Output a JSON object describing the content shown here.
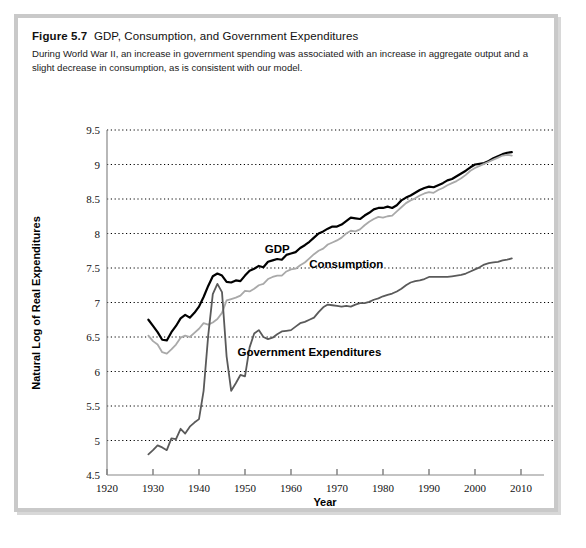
{
  "figure": {
    "label": "Figure 5.7",
    "title": "GDP, Consumption, and Government Expenditures",
    "description": "During World War II, an increase in government spending was associated with an increase in aggregate output and a slight decrease in consumption, as is consistent with our model."
  },
  "chart_data": {
    "type": "line",
    "title": "GDP, Consumption, and Government Expenditures",
    "xlabel": "Year",
    "ylabel": "Natural Log of Real Expenditures",
    "xlim": [
      1920,
      2015
    ],
    "ylim": [
      4.5,
      9.5
    ],
    "xticks": [
      1920,
      1930,
      1940,
      1950,
      1960,
      1970,
      1980,
      1990,
      2000,
      2010
    ],
    "yticks": [
      4.5,
      5,
      5.5,
      6,
      6.5,
      7,
      7.5,
      8,
      8.5,
      9,
      9.5
    ],
    "grid": "horizontal-dotted",
    "legend": "inline-annotations",
    "colors": {
      "gdp": "#000000",
      "consumption": "#a9a9a9",
      "government": "#5a5a5a"
    },
    "annotations": [
      {
        "text": "GDP",
        "x": 1957,
        "y": 7.72
      },
      {
        "text": "Consumption",
        "x": 1972,
        "y": 7.5
      },
      {
        "text": "Government Expenditures",
        "x": 1964,
        "y": 6.22
      }
    ],
    "series": [
      {
        "name": "GDP",
        "color": "#000000",
        "x": [
          1929,
          1930,
          1931,
          1932,
          1933,
          1934,
          1935,
          1936,
          1937,
          1938,
          1939,
          1940,
          1941,
          1942,
          1943,
          1944,
          1945,
          1946,
          1947,
          1948,
          1949,
          1950,
          1951,
          1952,
          1953,
          1954,
          1955,
          1956,
          1957,
          1958,
          1959,
          1960,
          1961,
          1962,
          1963,
          1964,
          1965,
          1966,
          1967,
          1968,
          1969,
          1970,
          1971,
          1972,
          1973,
          1974,
          1975,
          1976,
          1977,
          1978,
          1979,
          1980,
          1981,
          1982,
          1983,
          1984,
          1985,
          1986,
          1987,
          1988,
          1989,
          1990,
          1991,
          1992,
          1993,
          1994,
          1995,
          1996,
          1997,
          1998,
          1999,
          2000,
          2001,
          2002,
          2003,
          2004,
          2005,
          2006,
          2007,
          2008
        ],
        "y": [
          6.75,
          6.66,
          6.57,
          6.46,
          6.45,
          6.57,
          6.66,
          6.77,
          6.82,
          6.78,
          6.85,
          6.94,
          7.08,
          7.24,
          7.38,
          7.42,
          7.39,
          7.3,
          7.29,
          7.32,
          7.31,
          7.39,
          7.46,
          7.49,
          7.53,
          7.51,
          7.59,
          7.61,
          7.63,
          7.62,
          7.69,
          7.71,
          7.73,
          7.79,
          7.83,
          7.88,
          7.94,
          8.0,
          8.03,
          8.07,
          8.1,
          8.1,
          8.13,
          8.18,
          8.23,
          8.22,
          8.21,
          8.26,
          8.3,
          8.35,
          8.37,
          8.37,
          8.39,
          8.37,
          8.41,
          8.48,
          8.52,
          8.55,
          8.59,
          8.63,
          8.66,
          8.68,
          8.67,
          8.7,
          8.73,
          8.77,
          8.79,
          8.83,
          8.87,
          8.91,
          8.96,
          9.0,
          9.01,
          9.02,
          9.05,
          9.09,
          9.12,
          9.15,
          9.17,
          9.18
        ]
      },
      {
        "name": "Consumption",
        "color": "#a9a9a9",
        "x": [
          1929,
          1930,
          1931,
          1932,
          1933,
          1934,
          1935,
          1936,
          1937,
          1938,
          1939,
          1940,
          1941,
          1942,
          1943,
          1944,
          1945,
          1946,
          1947,
          1948,
          1949,
          1950,
          1951,
          1952,
          1953,
          1954,
          1955,
          1956,
          1957,
          1958,
          1959,
          1960,
          1961,
          1962,
          1963,
          1964,
          1965,
          1966,
          1967,
          1968,
          1969,
          1970,
          1971,
          1972,
          1973,
          1974,
          1975,
          1976,
          1977,
          1978,
          1979,
          1980,
          1981,
          1982,
          1983,
          1984,
          1985,
          1986,
          1987,
          1988,
          1989,
          1990,
          1991,
          1992,
          1993,
          1994,
          1995,
          1996,
          1997,
          1998,
          1999,
          2000,
          2001,
          2002,
          2003,
          2004,
          2005,
          2006,
          2007,
          2008
        ],
        "y": [
          6.52,
          6.44,
          6.39,
          6.28,
          6.26,
          6.32,
          6.39,
          6.49,
          6.52,
          6.5,
          6.56,
          6.62,
          6.7,
          6.68,
          6.71,
          6.76,
          6.85,
          7.03,
          7.05,
          7.07,
          7.1,
          7.17,
          7.16,
          7.2,
          7.25,
          7.27,
          7.34,
          7.37,
          7.39,
          7.39,
          7.45,
          7.48,
          7.49,
          7.54,
          7.58,
          7.64,
          7.7,
          7.75,
          7.78,
          7.84,
          7.87,
          7.9,
          7.94,
          8.0,
          8.04,
          8.03,
          8.06,
          8.12,
          8.17,
          8.21,
          8.24,
          8.23,
          8.25,
          8.26,
          8.32,
          8.38,
          8.44,
          8.48,
          8.51,
          8.55,
          8.58,
          8.6,
          8.59,
          8.63,
          8.66,
          8.7,
          8.73,
          8.76,
          8.8,
          8.85,
          8.91,
          8.95,
          8.98,
          9.01,
          9.04,
          9.07,
          9.1,
          9.13,
          9.14,
          9.13
        ]
      },
      {
        "name": "Government Expenditures",
        "color": "#5a5a5a",
        "x": [
          1929,
          1930,
          1931,
          1932,
          1933,
          1934,
          1935,
          1936,
          1937,
          1938,
          1939,
          1940,
          1941,
          1942,
          1943,
          1944,
          1945,
          1946,
          1947,
          1948,
          1949,
          1950,
          1951,
          1952,
          1953,
          1954,
          1955,
          1956,
          1957,
          1958,
          1959,
          1960,
          1961,
          1962,
          1963,
          1964,
          1965,
          1966,
          1967,
          1968,
          1969,
          1970,
          1971,
          1972,
          1973,
          1974,
          1975,
          1976,
          1977,
          1978,
          1979,
          1980,
          1981,
          1982,
          1983,
          1984,
          1985,
          1986,
          1987,
          1988,
          1989,
          1990,
          1991,
          1992,
          1993,
          1994,
          1995,
          1996,
          1997,
          1998,
          1999,
          2000,
          2001,
          2002,
          2003,
          2004,
          2005,
          2006,
          2007,
          2008
        ],
        "y": [
          4.8,
          4.86,
          4.93,
          4.9,
          4.86,
          5.03,
          5.02,
          5.17,
          5.1,
          5.2,
          5.26,
          5.31,
          5.72,
          6.52,
          7.12,
          7.27,
          7.15,
          6.22,
          5.72,
          5.83,
          5.95,
          5.93,
          6.35,
          6.55,
          6.6,
          6.5,
          6.47,
          6.49,
          6.54,
          6.58,
          6.59,
          6.6,
          6.65,
          6.7,
          6.72,
          6.75,
          6.78,
          6.86,
          6.93,
          6.97,
          6.96,
          6.95,
          6.94,
          6.95,
          6.94,
          6.97,
          6.99,
          6.99,
          7.01,
          7.04,
          7.06,
          7.09,
          7.11,
          7.13,
          7.16,
          7.2,
          7.25,
          7.29,
          7.31,
          7.32,
          7.34,
          7.37,
          7.37,
          7.37,
          7.37,
          7.37,
          7.38,
          7.39,
          7.4,
          7.42,
          7.45,
          7.48,
          7.51,
          7.55,
          7.57,
          7.58,
          7.59,
          7.61,
          7.62,
          7.64
        ]
      }
    ]
  }
}
